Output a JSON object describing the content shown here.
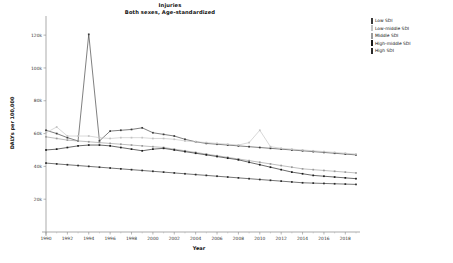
{
  "chart_data": {
    "type": "line",
    "title": "Injuries",
    "subtitle": "Both sexes, Age-standardized",
    "xlabel": "Year",
    "ylabel": "DALYs per 100,000",
    "xlim": [
      1990,
      2019
    ],
    "ylim": [
      0,
      128000
    ],
    "grid": false,
    "legend_position": "right",
    "x": [
      1990,
      1991,
      1992,
      1993,
      1994,
      1995,
      1996,
      1997,
      1998,
      1999,
      2000,
      2001,
      2002,
      2003,
      2004,
      2005,
      2006,
      2007,
      2008,
      2009,
      2010,
      2011,
      2012,
      2013,
      2014,
      2015,
      2016,
      2017,
      2018,
      2019
    ],
    "y_ticks": [
      20000,
      40000,
      60000,
      80000,
      100000,
      120000
    ],
    "y_tick_labels": [
      "20k",
      "40k",
      "60k",
      "80k",
      "100k",
      "120k"
    ],
    "x_ticks": [
      1990,
      1992,
      1994,
      1996,
      1998,
      2000,
      2002,
      2004,
      2006,
      2008,
      2010,
      2012,
      2014,
      2016,
      2018
    ],
    "x_tick_labels": [
      "1990",
      "1992",
      "1994",
      "1996",
      "1998",
      "2000",
      "2002",
      "2004",
      "2006",
      "2008",
      "2010",
      "2012",
      "2014",
      "2016",
      "2018"
    ],
    "series": [
      {
        "name": "Low SDI",
        "color": "#3a3a3a",
        "values": [
          62000,
          60000,
          57500,
          55500,
          120500,
          55500,
          61500,
          62000,
          62500,
          63500,
          60500,
          59500,
          58500,
          56500,
          55000,
          54000,
          53500,
          53000,
          52500,
          52000,
          51500,
          51000,
          50500,
          50000,
          49500,
          49000,
          48500,
          48000,
          47500,
          47000
        ]
      },
      {
        "name": "Low-middle SDI",
        "color": "#c2c2c2",
        "values": [
          60500,
          64000,
          58500,
          58500,
          58500,
          57500,
          57000,
          57500,
          57500,
          57500,
          57000,
          57000,
          56500,
          55500,
          55000,
          54500,
          54000,
          53500,
          53000,
          54500,
          62000,
          52000,
          51000,
          50500,
          50000,
          49500,
          49000,
          48500,
          48000,
          47500
        ]
      },
      {
        "name": "Middle SDI",
        "color": "#9a9a9a",
        "values": [
          58000,
          57000,
          56000,
          55500,
          55000,
          54500,
          54000,
          53500,
          53000,
          52500,
          52000,
          51500,
          50500,
          49500,
          48500,
          47500,
          46500,
          45500,
          44500,
          43500,
          42500,
          41500,
          40500,
          39500,
          38500,
          38000,
          37500,
          37000,
          36500,
          36000
        ]
      },
      {
        "name": "High-middle SDI",
        "color": "#1a1a1a",
        "values": [
          50000,
          50500,
          51500,
          52500,
          53000,
          53000,
          52500,
          51500,
          50500,
          49500,
          50500,
          51000,
          50000,
          49000,
          48000,
          47000,
          46000,
          45000,
          44000,
          42500,
          41000,
          39500,
          38000,
          36500,
          35500,
          34500,
          34000,
          33500,
          33000,
          32500
        ]
      },
      {
        "name": "High SDI",
        "color": "#2b2b2b",
        "values": [
          42000,
          41500,
          41000,
          40500,
          40000,
          39500,
          39000,
          38500,
          38000,
          37500,
          37000,
          36500,
          36000,
          35500,
          35000,
          34500,
          34000,
          33500,
          33000,
          32500,
          32000,
          31500,
          31000,
          30500,
          30000,
          29800,
          29600,
          29400,
          29200,
          29000
        ]
      }
    ]
  }
}
